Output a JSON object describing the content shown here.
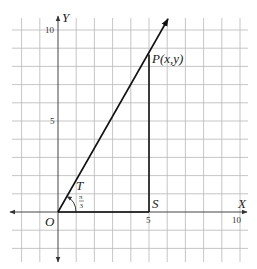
{
  "diagram": {
    "type": "coordinate-geometry",
    "axes": {
      "x_label": "X",
      "y_label": "Y",
      "origin_label": "O",
      "x_ticks": [
        {
          "value": 5,
          "label": "5"
        },
        {
          "value": 10,
          "label": "10"
        }
      ],
      "y_ticks": [
        {
          "value": 5,
          "label": "5"
        },
        {
          "value": 10,
          "label": "10"
        }
      ],
      "grid_range_x": [
        -2,
        10
      ],
      "grid_range_y": [
        -2,
        10
      ]
    },
    "points": {
      "P": {
        "label": "P(x,y)",
        "x": 5,
        "y": 8.66
      },
      "S": {
        "label": "S",
        "x": 5,
        "y": 0
      },
      "T": {
        "label": "T"
      }
    },
    "angle": {
      "label_num": "π",
      "label_den": "3",
      "value": "π/3"
    },
    "colors": {
      "grid": "#b8b8b8",
      "lines": "#111111",
      "background": "#ffffff"
    }
  }
}
